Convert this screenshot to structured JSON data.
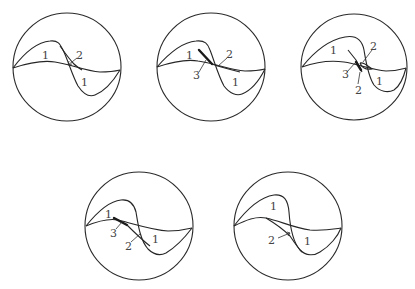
{
  "figure": {
    "panels": [
      {
        "id": "a",
        "labels": {
          "l1": "1",
          "l2": "2",
          "l3": "1"
        }
      },
      {
        "id": "b",
        "labels": {
          "l1": "1",
          "l2": "2",
          "l3": "3",
          "l4": "1"
        }
      },
      {
        "id": "c",
        "labels": {
          "l1": "1",
          "l2": "2",
          "l3": "3",
          "l4": "2",
          "l5": "1"
        }
      },
      {
        "id": "d",
        "labels": {
          "l1": "1",
          "l2": "3",
          "l3": "2",
          "l4": "1"
        }
      },
      {
        "id": "e",
        "labels": {
          "l1": "1",
          "l2": "2",
          "l3": "1"
        }
      }
    ],
    "colors": {
      "line": "#262626",
      "label": "#444444",
      "background": "#ffffff"
    }
  }
}
